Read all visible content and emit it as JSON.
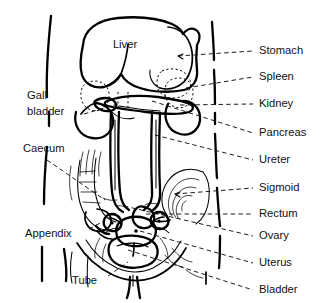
{
  "figure": {
    "background_color": "#ffffff",
    "ink_color": "#000000",
    "label_color": "#111111"
  },
  "organ_labels": [
    {
      "key": "liver",
      "text": "Liver",
      "x": 125,
      "y": 48,
      "placement": "inside"
    }
  ],
  "left_labels": [
    {
      "key": "gall-bladder",
      "lines": [
        "Gall",
        "bladder"
      ],
      "text": "Gall bladder",
      "x": 27,
      "y": 96,
      "y2": 112,
      "leader": {
        "x1": 84,
        "y1": 114,
        "x2": 118,
        "y2": 104
      }
    },
    {
      "key": "caecum",
      "lines": [
        "Caecum"
      ],
      "text": "Caecum",
      "x": 23,
      "y": 149,
      "leader": {
        "x1": 47,
        "y1": 160,
        "x2": 105,
        "y2": 200
      }
    },
    {
      "key": "appendix",
      "lines": [
        "Appendix"
      ],
      "text": "Appendix",
      "x": 25,
      "y": 234,
      "leader": {
        "x1": 89,
        "y1": 229,
        "x2": 104,
        "y2": 221
      }
    },
    {
      "key": "tube",
      "lines": [
        "Tube"
      ],
      "text": "Tube",
      "x": 72,
      "y": 281,
      "leader": {
        "x1": 108,
        "y1": 276,
        "x2": 128,
        "y2": 262
      }
    }
  ],
  "right_labels": [
    {
      "key": "stomach",
      "text": "Stomach",
      "x": 259,
      "y": 51,
      "leader": {
        "x1": 178,
        "y1": 56,
        "x2": 253,
        "y2": 51
      }
    },
    {
      "key": "spleen",
      "text": "Spleen",
      "x": 259,
      "y": 77,
      "leader": {
        "x1": 186,
        "y1": 88,
        "x2": 253,
        "y2": 77
      }
    },
    {
      "key": "kidney",
      "text": "Kidney",
      "x": 259,
      "y": 104,
      "leader": {
        "x1": 180,
        "y1": 105,
        "x2": 253,
        "y2": 104
      }
    },
    {
      "key": "pancreas",
      "text": "Pancreas",
      "x": 259,
      "y": 133,
      "leader": {
        "x1": 152,
        "y1": 101,
        "x2": 253,
        "y2": 133
      }
    },
    {
      "key": "ureter",
      "text": "Ureter",
      "x": 259,
      "y": 160,
      "leader": {
        "x1": 155,
        "y1": 135,
        "x2": 253,
        "y2": 160
      }
    },
    {
      "key": "sigmoid",
      "text": "Sigmoid",
      "x": 259,
      "y": 188,
      "leader": {
        "x1": 175,
        "y1": 194,
        "x2": 253,
        "y2": 188
      }
    },
    {
      "key": "rectum",
      "text": "Rectum",
      "x": 259,
      "y": 214,
      "leader": {
        "x1": 146,
        "y1": 214,
        "x2": 253,
        "y2": 214
      }
    },
    {
      "key": "ovary",
      "text": "Ovary",
      "x": 259,
      "y": 236,
      "leader": {
        "x1": 124,
        "y1": 206,
        "x2": 253,
        "y2": 236
      }
    },
    {
      "key": "uterus",
      "text": "Uterus",
      "x": 259,
      "y": 263,
      "leader": {
        "x1": 140,
        "y1": 231,
        "x2": 253,
        "y2": 263
      }
    },
    {
      "key": "bladder",
      "text": "Bladder",
      "x": 259,
      "y": 290,
      "leader": {
        "x1": 128,
        "y1": 250,
        "x2": 253,
        "y2": 290
      }
    }
  ]
}
